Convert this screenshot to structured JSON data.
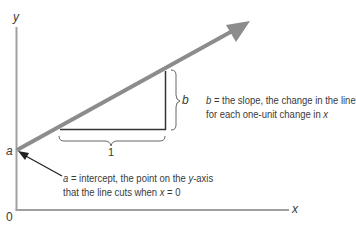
{
  "diagram": {
    "type": "linear-regression-line",
    "axes": {
      "y_label": "y",
      "x_label": "x",
      "origin_label": "0"
    },
    "intercept": {
      "symbol": "a",
      "description_line1_symbol": "a",
      "description_line1_rest": " = intercept, the point on the ",
      "description_line1_axis": "y",
      "description_line1_tail": "-axis",
      "description_line2_prefix": "that the line cuts when ",
      "description_line2_var": "x",
      "description_line2_suffix": " = 0"
    },
    "slope": {
      "symbol": "b",
      "run_label": "1",
      "description_line1_symbol": "b",
      "description_line1_rest": " = the slope, the change in the line",
      "description_line2_prefix": "for each one-unit change in ",
      "description_line2_var": "x"
    },
    "colors": {
      "line": "#8c8c8c",
      "axes": "#9a9a9a",
      "triangle": "#333333",
      "text": "#3a3a3a"
    }
  }
}
